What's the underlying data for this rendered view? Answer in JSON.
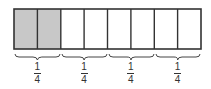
{
  "diagram": {
    "total_parts": 8,
    "shaded_parts": 2,
    "colors": {
      "border": "#333333",
      "shaded_fill": "#c8c8c8",
      "unshaded_fill": "#ffffff"
    },
    "groups": [
      {
        "numerator": "1",
        "denominator": "4"
      },
      {
        "numerator": "1",
        "denominator": "4"
      },
      {
        "numerator": "1",
        "denominator": "4"
      },
      {
        "numerator": "1",
        "denominator": "4"
      }
    ]
  }
}
